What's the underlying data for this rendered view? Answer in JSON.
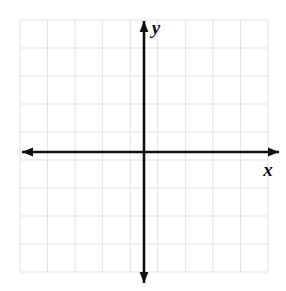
{
  "figure": {
    "title": "",
    "width": 286,
    "height": 291,
    "background_color": "#ffffff"
  },
  "chart_data": {
    "type": "scatter",
    "title": "",
    "subtitle": "",
    "xlabel": "x",
    "ylabel": "y",
    "xlim": [
      -4.5,
      4.5
    ],
    "ylim": [
      -4.8,
      4.2
    ],
    "x": [],
    "y": [],
    "series": [],
    "annotations": [],
    "grid": true,
    "grid_spacing": 1,
    "legend": false,
    "legend_position": "none",
    "xticks": [],
    "yticks": [],
    "xticklabels": [],
    "yticklabels": []
  },
  "grid": {
    "line_color": "#e3e3e3",
    "line_width": 1,
    "left": 20,
    "top": 20,
    "right": 268,
    "bottom": 272,
    "columns": 9,
    "rows": 9,
    "cell_size": 27.5
  },
  "axes": {
    "color": "#111111",
    "line_width": 2.6,
    "origin_x": 144,
    "origin_y": 152,
    "x_axis": {
      "label": "x",
      "label_x": 268,
      "label_y": 176,
      "start_x": 22,
      "end_x": 279,
      "y": 152,
      "arrow_left": true,
      "arrow_right": true
    },
    "y_axis": {
      "label": "y",
      "label_x": 156,
      "label_y": 34,
      "start_y": 21,
      "end_y": 283,
      "x": 144,
      "arrow_up": true,
      "arrow_down": true
    }
  }
}
